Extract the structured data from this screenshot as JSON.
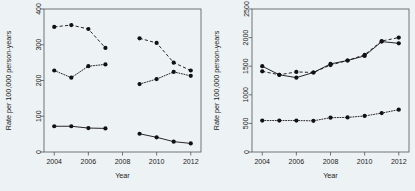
{
  "figure": {
    "background_color": "#edf2f4",
    "panel_count": 2
  },
  "chart_data": [
    {
      "type": "line",
      "panel": "left",
      "title": "",
      "xlabel": "Year",
      "ylabel": "Rate per 100,000 person-years",
      "xlim": [
        2003.4,
        2012.6
      ],
      "ylim": [
        0,
        400
      ],
      "xticks": [
        2004,
        2006,
        2008,
        2010,
        2012
      ],
      "xtick_labels": [
        "2004",
        "2006",
        "2008",
        "2010",
        "2012"
      ],
      "yticks": [
        0,
        100,
        200,
        300,
        400
      ],
      "ytick_labels": [
        "0",
        "100",
        "200",
        "300",
        "400"
      ],
      "grid": false,
      "legend": "none",
      "note": "Data gap between 2007 and 2009; each series is split into two segments.",
      "series": [
        {
          "name": "series-a-dashed",
          "linestyle": "dashed",
          "marker": "filled-circle",
          "segments": [
            {
              "x": [
                2004,
                2005,
                2006,
                2007
              ],
              "y": [
                350,
                355,
                344,
                291
              ]
            },
            {
              "x": [
                2009,
                2010,
                2011,
                2012
              ],
              "y": [
                318,
                305,
                250,
                228
              ]
            }
          ]
        },
        {
          "name": "series-b-dotted",
          "linestyle": "dotted",
          "marker": "filled-circle",
          "segments": [
            {
              "x": [
                2004,
                2005,
                2006,
                2007
              ],
              "y": [
                228,
                208,
                240,
                245
              ]
            },
            {
              "x": [
                2009,
                2010,
                2011,
                2012
              ],
              "y": [
                190,
                204,
                224,
                213
              ]
            }
          ]
        },
        {
          "name": "series-c-solid",
          "linestyle": "solid",
          "marker": "filled-circle",
          "segments": [
            {
              "x": [
                2004,
                2005,
                2006,
                2007
              ],
              "y": [
                72,
                72,
                67,
                66
              ]
            },
            {
              "x": [
                2009,
                2010,
                2011,
                2012
              ],
              "y": [
                51,
                41,
                29,
                24
              ]
            }
          ]
        }
      ]
    },
    {
      "type": "line",
      "panel": "right",
      "title": "",
      "xlabel": "Year",
      "ylabel": "Rate per 100,000 person-years",
      "xlim": [
        2003.4,
        2012.6
      ],
      "ylim": [
        0,
        2500
      ],
      "xticks": [
        2004,
        2006,
        2008,
        2010,
        2012
      ],
      "xtick_labels": [
        "2004",
        "2006",
        "2008",
        "2010",
        "2012"
      ],
      "yticks": [
        0,
        500,
        1000,
        1500,
        2000,
        2500
      ],
      "ytick_labels": [
        "0",
        "500",
        "1000",
        "1500",
        "2000",
        "2500"
      ],
      "grid": false,
      "legend": "none",
      "note": "Continuous series across 2004-2012; solid and dashed series nearly overlap.",
      "series": [
        {
          "name": "series-a-solid",
          "linestyle": "solid",
          "marker": "filled-circle",
          "segments": [
            {
              "x": [
                2004,
                2005,
                2006,
                2007,
                2008,
                2009,
                2010,
                2011,
                2012
              ],
              "y": [
                1500,
                1350,
                1300,
                1390,
                1540,
                1600,
                1680,
                1930,
                1900
              ]
            }
          ]
        },
        {
          "name": "series-b-dashed",
          "linestyle": "dashed",
          "marker": "filled-circle",
          "segments": [
            {
              "x": [
                2004,
                2005,
                2006,
                2007,
                2008,
                2009,
                2010,
                2011,
                2012
              ],
              "y": [
                1410,
                1350,
                1400,
                1390,
                1520,
                1600,
                1700,
                1940,
                2000
              ]
            }
          ]
        },
        {
          "name": "series-c-dotted",
          "linestyle": "dotted",
          "marker": "filled-circle",
          "segments": [
            {
              "x": [
                2004,
                2005,
                2006,
                2007,
                2008,
                2009,
                2010,
                2011,
                2012
              ],
              "y": [
                550,
                550,
                550,
                545,
                600,
                605,
                630,
                680,
                740
              ]
            }
          ]
        }
      ]
    }
  ]
}
